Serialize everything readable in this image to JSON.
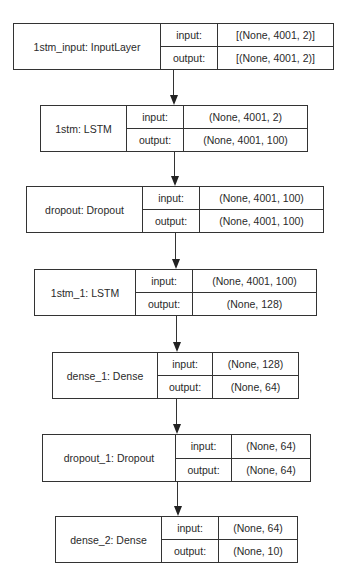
{
  "diagram": {
    "type": "keras-model-plot",
    "colors": {
      "border": "#333333",
      "text": "#2a2a2a",
      "background": "#ffffff"
    },
    "field_labels": {
      "input": "input:",
      "output": "output:"
    },
    "nodes": [
      {
        "id": "n0",
        "label": "1stm_input: InputLayer",
        "input": "[(None, 4001, 2)]",
        "output": "[(None, 4001, 2)]",
        "box": {
          "x": 13,
          "y": 23,
          "w": 321,
          "h": 47,
          "name_w": 147,
          "key_w": 57
        }
      },
      {
        "id": "n1",
        "label": "1stm: LSTM",
        "input": "(None, 4001, 2)",
        "output": "(None, 4001, 100)",
        "box": {
          "x": 40,
          "y": 105,
          "w": 268,
          "h": 47,
          "name_w": 86,
          "key_w": 57
        }
      },
      {
        "id": "n2",
        "label": "dropout: Dropout",
        "input": "(None, 4001, 100)",
        "output": "(None, 4001, 100)",
        "box": {
          "x": 26,
          "y": 186,
          "w": 298,
          "h": 47,
          "name_w": 116,
          "key_w": 57
        }
      },
      {
        "id": "n3",
        "label": "1stm_1: LSTM",
        "input": "(None, 4001, 100)",
        "output": "(None, 128)",
        "box": {
          "x": 34,
          "y": 269,
          "w": 283,
          "h": 47,
          "name_w": 101,
          "key_w": 57
        }
      },
      {
        "id": "n4",
        "label": "dense_1: Dense",
        "input": "(None, 128)",
        "output": "(None, 64)",
        "box": {
          "x": 52,
          "y": 352,
          "w": 247,
          "h": 47,
          "name_w": 105,
          "key_w": 55
        }
      },
      {
        "id": "n5",
        "label": "dropout_1: Dropout",
        "input": "(None, 64)",
        "output": "(None, 64)",
        "box": {
          "x": 42,
          "y": 434,
          "w": 269,
          "h": 48,
          "name_w": 133,
          "key_w": 56
        }
      },
      {
        "id": "n6",
        "label": "dense_2: Dense",
        "input": "(None, 64)",
        "output": "(None, 10)",
        "box": {
          "x": 55,
          "y": 516,
          "w": 243,
          "h": 47,
          "name_w": 106,
          "key_w": 57
        }
      }
    ],
    "edges": [
      {
        "from": "n0",
        "to": "n1",
        "x": 173,
        "y1": 70,
        "y2": 105
      },
      {
        "from": "n1",
        "to": "n2",
        "x": 174,
        "y1": 152,
        "y2": 186
      },
      {
        "from": "n2",
        "to": "n3",
        "x": 175,
        "y1": 233,
        "y2": 269
      },
      {
        "from": "n3",
        "to": "n4",
        "x": 176,
        "y1": 316,
        "y2": 352
      },
      {
        "from": "n4",
        "to": "n5",
        "x": 176,
        "y1": 399,
        "y2": 434
      },
      {
        "from": "n5",
        "to": "n6",
        "x": 177,
        "y1": 482,
        "y2": 516
      }
    ]
  }
}
